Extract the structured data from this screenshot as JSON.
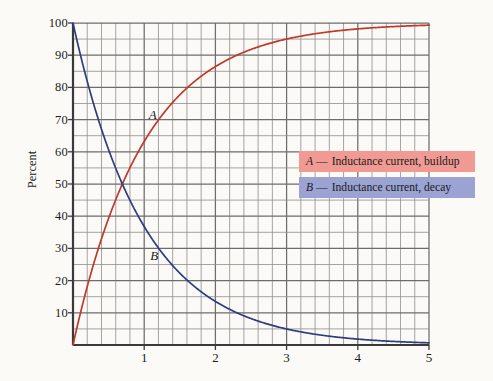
{
  "chart_data": {
    "type": "line",
    "title": "",
    "xlabel": "",
    "ylabel": "Percent",
    "xlim": [
      0,
      5
    ],
    "ylim": [
      0,
      100
    ],
    "grid": true,
    "x_major_ticks": [
      1,
      2,
      3,
      4,
      5
    ],
    "x_minor_step": 0.2,
    "y_major_ticks": [
      10,
      20,
      30,
      40,
      50,
      60,
      70,
      80,
      90,
      100
    ],
    "y_minor_step": 5,
    "legend_position": "inside-right-upper",
    "series": [
      {
        "name": "A",
        "label": "Inductance current, buildup",
        "color": "#c0392b",
        "equation": "100*(1 - exp(-x))",
        "x": [
          0,
          0.2,
          0.4,
          0.6,
          0.8,
          1.0,
          1.2,
          1.4,
          1.6,
          1.8,
          2.0,
          2.2,
          2.4,
          2.6,
          2.8,
          3.0,
          3.2,
          3.4,
          3.6,
          3.8,
          4.0,
          4.2,
          4.4,
          4.6,
          4.8,
          5.0
        ],
        "values": [
          0,
          18.1,
          33.0,
          45.1,
          55.1,
          63.2,
          69.9,
          75.3,
          79.8,
          83.5,
          86.5,
          88.9,
          90.9,
          92.6,
          93.9,
          95.0,
          95.9,
          96.7,
          97.3,
          97.8,
          98.2,
          98.5,
          98.8,
          99.0,
          99.2,
          99.3
        ]
      },
      {
        "name": "B",
        "label": "Inductance current, decay",
        "color": "#2f3d80",
        "equation": "100*exp(-x)",
        "x": [
          0,
          0.2,
          0.4,
          0.6,
          0.8,
          1.0,
          1.2,
          1.4,
          1.6,
          1.8,
          2.0,
          2.2,
          2.4,
          2.6,
          2.8,
          3.0,
          3.2,
          3.4,
          3.6,
          3.8,
          4.0,
          4.2,
          4.4,
          4.6,
          4.8,
          5.0
        ],
        "values": [
          100,
          81.9,
          67.0,
          54.9,
          44.9,
          36.8,
          30.1,
          24.7,
          20.2,
          16.5,
          13.5,
          11.1,
          9.1,
          7.4,
          6.1,
          5.0,
          4.1,
          3.3,
          2.7,
          2.2,
          1.8,
          1.5,
          1.2,
          1.0,
          0.8,
          0.7
        ]
      }
    ],
    "annotations": [
      {
        "text": "A",
        "x": 1.12,
        "y": 71.5
      },
      {
        "text": "B",
        "x": 1.14,
        "y": 27.5
      }
    ]
  },
  "legend": {
    "items": [
      {
        "key": "A",
        "dash": "—",
        "label": "Inductance current, buildup",
        "background": "#f09a93"
      },
      {
        "key": "B",
        "dash": "—",
        "label": "Inductance current, decay",
        "background": "#9aa3d2"
      }
    ]
  },
  "axes": {
    "y_title": "Percent",
    "y_labels": [
      "100",
      "90",
      "80",
      "70",
      "60",
      "50",
      "40",
      "30",
      "20",
      "10"
    ],
    "x_labels": [
      "1",
      "2",
      "3",
      "4",
      "5"
    ]
  },
  "colors": {
    "background": "#fbfaf7",
    "axis": "#3a3a3a",
    "grid_major": "#6d6d6d",
    "grid_minor": "#8e8e8e",
    "series_a": "#c0392b",
    "series_b": "#2f3d80"
  }
}
